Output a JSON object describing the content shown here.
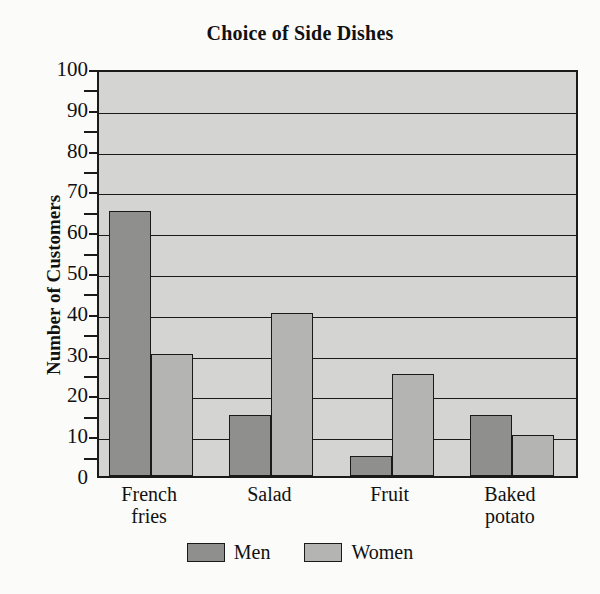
{
  "chart_data": {
    "type": "bar",
    "title": "Choice of Side Dishes",
    "xlabel": "",
    "ylabel": "Number of Customers",
    "categories": [
      "French\nfries",
      "Salad",
      "Fruit",
      "Baked\npotato"
    ],
    "series": [
      {
        "name": "Men",
        "values": [
          65,
          15,
          5,
          15
        ],
        "color": "#8f8f8d"
      },
      {
        "name": "Women",
        "values": [
          30,
          40,
          25,
          10
        ],
        "color": "#b4b4b2"
      }
    ],
    "ylim": [
      0,
      100
    ],
    "ytick_step": 10,
    "yminor_step": 5,
    "yticks": [
      0,
      10,
      20,
      30,
      40,
      50,
      60,
      70,
      80,
      90,
      100
    ],
    "yminor_ticks": [
      5,
      15,
      25,
      35,
      45,
      55,
      65,
      75,
      85,
      95
    ],
    "grid": true,
    "grid_axis": "y",
    "legend_position": "bottom",
    "plot_background": "#d4d4d2",
    "axis_color": "#1a1a1a"
  },
  "legend": {
    "entries": [
      {
        "label": "Men"
      },
      {
        "label": "Women"
      }
    ]
  }
}
